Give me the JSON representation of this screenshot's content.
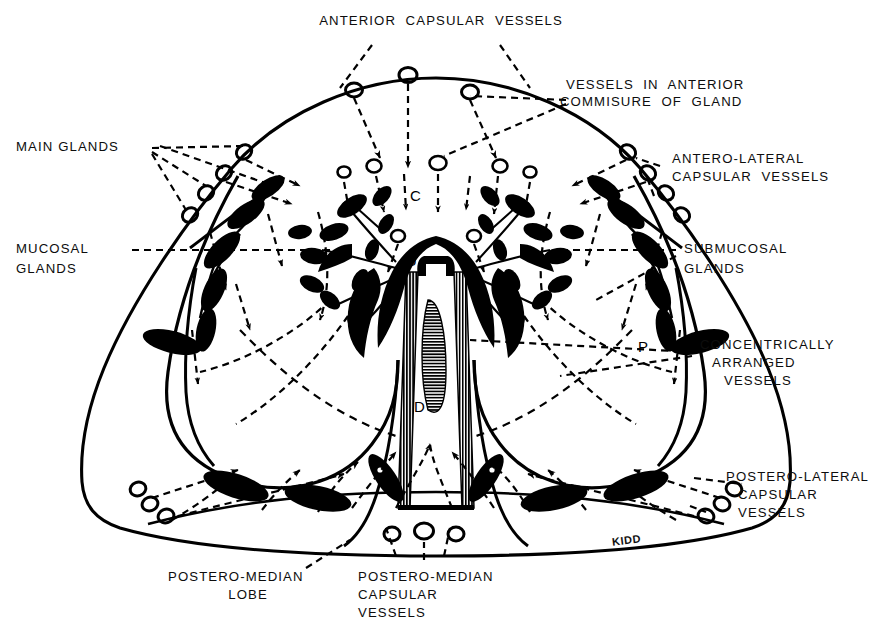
{
  "figure": {
    "title_implicit": "Cross-section diagram of the prostate gland showing capsular vessels and glandular zones",
    "signature": "KIDD",
    "ink_color": "#000000",
    "background_color": "#ffffff"
  },
  "labels": {
    "anterior_capsular_vessels": "ANTERIOR  CAPSULAR  VESSELS",
    "vessels_in_anterior_commisure_line1": "VESSELS  IN  ANTERIOR",
    "vessels_in_anterior_commisure_line2": "COMMISURE  OF  GLAND",
    "antero_lateral_line1": "ANTERO-LATERAL",
    "antero_lateral_line2": "CAPSULAR  VESSELS",
    "main_glands": "MAIN GLANDS",
    "mucosal_glands_line1": "MUCOSAL",
    "mucosal_glands_line2": "GLANDS",
    "submucosal_glands_line1": "SUBMUCOSAL",
    "submucosal_glands_line2": "GLANDS",
    "concentrically_line1": "CONCENTRICALLY",
    "concentrically_line2": "ARRANGED",
    "concentrically_line3": "VESSELS",
    "postero_lateral_line1": "POSTERO-LATERAL",
    "postero_lateral_line2": "CAPSULAR",
    "postero_lateral_line3": "VESSELS",
    "postero_median_lobe_line1": "POSTERO-MEDIAN",
    "postero_median_lobe_line2": "LOBE",
    "postero_median_capsular_line1": "POSTERO-MEDIAN",
    "postero_median_capsular_line2": "CAPSULAR",
    "postero_median_capsular_line3": "VESSELS"
  },
  "anatomical_markers": {
    "c": "C",
    "u": "U",
    "d": "D",
    "p_left": "P",
    "p_right": "P"
  }
}
